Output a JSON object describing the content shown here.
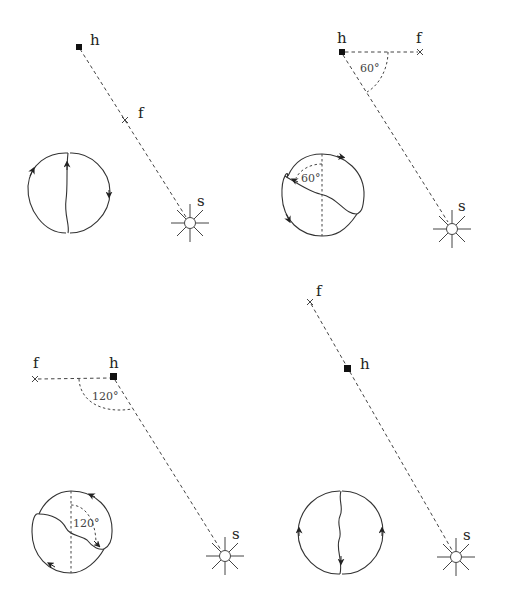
{
  "figure": {
    "panels": [
      {
        "id": "panel-1",
        "labels": {
          "h": "h",
          "f": "f",
          "s": "s"
        },
        "angle": null,
        "points": {
          "h": [
            79,
            47
          ],
          "f": [
            125,
            120
          ],
          "s": [
            190,
            222
          ]
        },
        "loop": {
          "center": [
            68,
            188
          ],
          "angle_label": null
        }
      },
      {
        "id": "panel-2",
        "labels": {
          "h": "h",
          "f": "f",
          "s": "s"
        },
        "angle": "60°",
        "points": {
          "h": [
            342,
            52
          ],
          "f": [
            420,
            52
          ],
          "s": [
            452,
            228
          ]
        },
        "loop": {
          "center": [
            322,
            200
          ],
          "angle_label": "60°"
        }
      },
      {
        "id": "panel-3",
        "labels": {
          "h": "h",
          "f": "f",
          "s": "s"
        },
        "angle": "120°",
        "points": {
          "h": [
            113,
            377
          ],
          "f": [
            35,
            379
          ],
          "s": [
            225,
            555
          ]
        },
        "loop": {
          "center": [
            71,
            535
          ],
          "angle_label": "120°"
        }
      },
      {
        "id": "panel-4",
        "labels": {
          "h": "h",
          "f": "f",
          "s": "s"
        },
        "angle": null,
        "points": {
          "h": [
            348,
            368
          ],
          "f": [
            310,
            302
          ],
          "s": [
            456,
            556
          ]
        },
        "loop": {
          "center": [
            340,
            533
          ],
          "angle_label": null
        }
      }
    ]
  }
}
